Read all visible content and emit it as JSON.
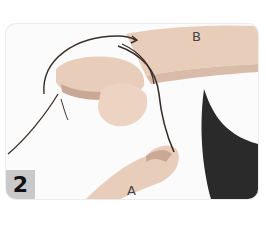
{
  "figure": {
    "step_number": "2",
    "labels": {
      "a": "A",
      "b": "B"
    },
    "colors": {
      "skin": "#e8cdbb",
      "skin_shadow": "#c9a896",
      "cord": "#3a2e2a",
      "clothing": "#2a2a2a",
      "badge": "#c9c9c9",
      "background": "#fbfbfb"
    }
  }
}
